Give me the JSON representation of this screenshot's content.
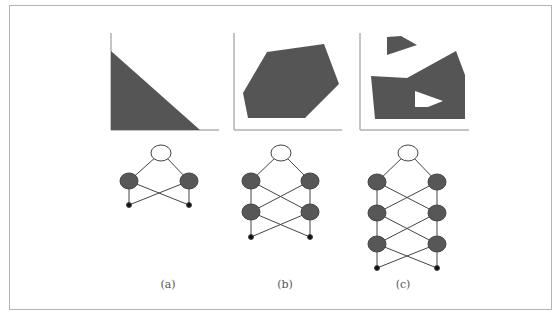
{
  "figure": {
    "colors": {
      "fill": "#555555",
      "axis": "#b0b0b0",
      "edge": "#444444",
      "output_node_fill": "#ffffff",
      "hidden_node_fill": "#575757",
      "input_node_fill": "#111111"
    },
    "panels": [
      {
        "id": "a",
        "caption": "(a)",
        "region": "half-plane (triangle under a line)",
        "network": {
          "hidden_layers": 1,
          "units_per_layer": 2,
          "inputs": 2,
          "outputs": 1
        }
      },
      {
        "id": "b",
        "caption": "(b)",
        "region": "convex polygon",
        "network": {
          "hidden_layers": 2,
          "units_per_layer": 2,
          "inputs": 2,
          "outputs": 1
        }
      },
      {
        "id": "c",
        "caption": "(c)",
        "region": "arbitrary non-convex regions with hole",
        "network": {
          "hidden_layers": 3,
          "units_per_layer": 2,
          "inputs": 2,
          "outputs": 1
        }
      }
    ]
  }
}
